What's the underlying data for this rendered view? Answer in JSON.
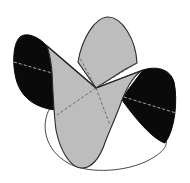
{
  "figure": {
    "title": "Monkey saddle surface",
    "colors": {
      "background": "#ffffff",
      "front_face": "#bdbdbd",
      "back_face": "#0a0a0a",
      "edge": "#2a2a2a",
      "dash_on_gray": "#555555",
      "dash_on_black": "#cfcfcf"
    },
    "parts": [
      {
        "name": "top-gray-lobe",
        "fill": "front_face"
      },
      {
        "name": "left-black-lobe",
        "fill": "back_face"
      },
      {
        "name": "right-black-lobe",
        "fill": "back_face"
      },
      {
        "name": "bottom-gray-lobe",
        "fill": "front_face"
      },
      {
        "name": "base-outline",
        "fill": "none"
      }
    ]
  }
}
